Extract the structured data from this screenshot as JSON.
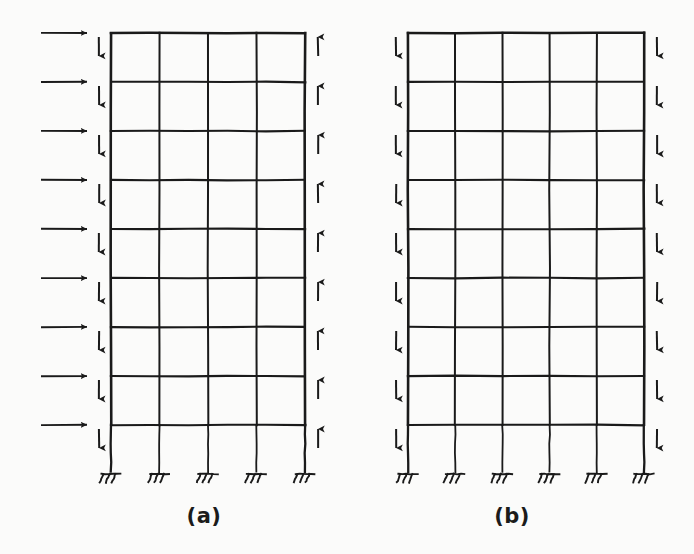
{
  "figure": {
    "background_color": "#fbfbfa",
    "line_color": "#1a1a1a",
    "width": 694,
    "height": 554
  },
  "frames": [
    {
      "id": "frame-a",
      "caption": "(a)",
      "caption_x": 204,
      "caption_y": 523,
      "bays": 4,
      "stories": 9,
      "columns_count": 5,
      "beam_levels": 9,
      "support_type": "fixed",
      "supports_count": 5,
      "geometry": {
        "left": 111,
        "right": 305,
        "top": 33,
        "lowest_beam": 425,
        "base": 472,
        "bay_width": 48.5,
        "story_height": 49,
        "ground_story_height": 47
      },
      "loads": [
        {
          "name": "lateral-load-arrows",
          "direction": "right",
          "count": 9,
          "side": "left-exterior",
          "label": "horizontal lateral load"
        },
        {
          "name": "left-column-vertical-arrows",
          "direction": "down",
          "count": 9,
          "side": "left-column",
          "label": "downward axial load"
        },
        {
          "name": "right-column-vertical-arrows",
          "direction": "up",
          "count": 9,
          "side": "right-column",
          "label": "upward axial load"
        }
      ]
    },
    {
      "id": "frame-b",
      "caption": "(b)",
      "caption_x": 512,
      "caption_y": 523,
      "bays": 5,
      "stories": 9,
      "columns_count": 6,
      "beam_levels": 9,
      "support_type": "fixed",
      "supports_count": 6,
      "geometry": {
        "left": 408,
        "right": 644,
        "top": 33,
        "lowest_beam": 425,
        "base": 472,
        "bay_width": 47.2,
        "story_height": 49,
        "ground_story_height": 47
      },
      "loads": [
        {
          "name": "left-column-vertical-arrows",
          "direction": "down",
          "count": 9,
          "side": "left-column",
          "label": "downward axial load"
        },
        {
          "name": "right-column-vertical-arrows",
          "direction": "down",
          "count": 9,
          "side": "right-column",
          "label": "downward axial load"
        }
      ]
    }
  ]
}
